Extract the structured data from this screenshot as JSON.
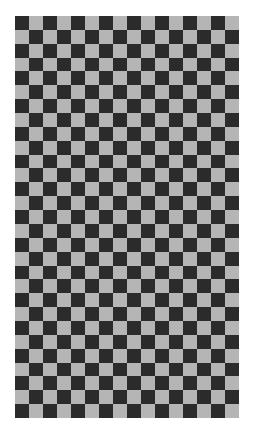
{
  "image": {
    "description": "Checkerboard pattern",
    "columns": 16,
    "rows": 29,
    "first_cell": "dark",
    "colors": {
      "dark": "#2b2b2b",
      "light": "#b5b5b5",
      "background": "#ffffff"
    }
  }
}
